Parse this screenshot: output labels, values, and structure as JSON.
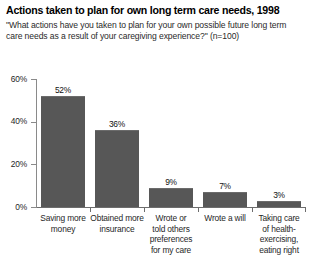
{
  "chart_data": {
    "type": "bar",
    "title": "Actions taken to plan for own long term care needs, 1998",
    "subtitle": "\"What actions have you taken to plan for your own possible future long term care needs as a result of your caregiving experience?\" (n=100)",
    "xlabel": "",
    "ylabel": "",
    "ylim": [
      0,
      60
    ],
    "yticks": [
      "0%",
      "20%",
      "40%",
      "60%"
    ],
    "ytick_values": [
      0,
      20,
      40,
      60
    ],
    "grid": false,
    "legend": false,
    "bar_color": "#575757",
    "categories": [
      "Saving more money",
      "Obtained more insurance",
      "Wrote or told others preferences for my care",
      "Wrote a will",
      "Taking care of health- exercising, eating right"
    ],
    "category_lines": [
      [
        "Saving more",
        "money"
      ],
      [
        "Obtained more",
        "insurance"
      ],
      [
        "Wrote or",
        "told others",
        "preferences",
        "for my care"
      ],
      [
        "Wrote a will"
      ],
      [
        "Taking care",
        "of health-",
        "exercising,",
        "eating right"
      ]
    ],
    "values": [
      52,
      36,
      9,
      7,
      3
    ],
    "value_labels": [
      "52%",
      "36%",
      "9%",
      "7%",
      "3%"
    ]
  }
}
